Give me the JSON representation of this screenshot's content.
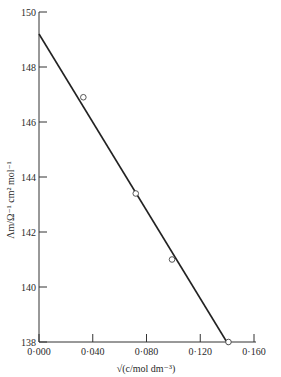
{
  "chart_data": {
    "type": "scatter",
    "title": "",
    "xlabel": "√(c/mol dm⁻³)",
    "ylabel": "Λm/Ω⁻¹ cm² mol⁻¹",
    "xlim": [
      0.0,
      0.16
    ],
    "ylim": [
      138,
      150
    ],
    "x_ticks": [
      "0·000",
      "0·040",
      "0·080",
      "0·120",
      "0·160"
    ],
    "y_ticks": [
      "138",
      "140",
      "142",
      "144",
      "146",
      "148",
      "150"
    ],
    "grid": false,
    "legend": null,
    "series": [
      {
        "name": "measured",
        "marker": "open-circle",
        "x": [
          0.033,
          0.072,
          0.099,
          0.141
        ],
        "y": [
          146.9,
          143.4,
          141.0,
          138.0
        ]
      },
      {
        "name": "fit",
        "style": "line",
        "x": [
          0.0,
          0.141
        ],
        "y": [
          149.2,
          137.9
        ]
      }
    ]
  }
}
